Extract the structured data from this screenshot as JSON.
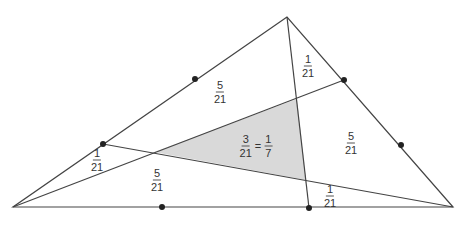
{
  "diagram": {
    "type": "triangle-cevians-area",
    "colors": {
      "stroke": "#444444",
      "fill_shaded": "#d9d9d9",
      "dot": "#222222",
      "background": "#ffffff"
    },
    "vertices": {
      "apex": [
        287,
        17
      ],
      "left": [
        13,
        207
      ],
      "right": [
        453,
        207
      ]
    },
    "dots": [
      {
        "name": "dot-left-side-lower",
        "pos": [
          103,
          144
        ]
      },
      {
        "name": "dot-left-side-upper",
        "pos": [
          195,
          79
        ]
      },
      {
        "name": "dot-right-side-upper",
        "pos": [
          344,
          80
        ]
      },
      {
        "name": "dot-right-side-lower",
        "pos": [
          401,
          145
        ]
      },
      {
        "name": "dot-base-left",
        "pos": [
          162,
          207
        ]
      },
      {
        "name": "dot-base-right",
        "pos": [
          309,
          208
        ]
      }
    ],
    "cevians": [
      {
        "from": [
          13,
          207
        ],
        "to": [
          344,
          80
        ]
      },
      {
        "from": [
          287,
          17
        ],
        "to": [
          309,
          208
        ]
      },
      {
        "from": [
          453,
          207
        ],
        "to": [
          103,
          144
        ]
      }
    ],
    "shaded_triangle": [
      [
        154,
        152
      ],
      [
        297,
        99
      ],
      [
        306,
        180
      ]
    ],
    "labels": [
      {
        "name": "label-top-sliver",
        "num": "1",
        "den": "21",
        "pos": [
          308,
          66
        ]
      },
      {
        "name": "label-upper-left",
        "num": "5",
        "den": "21",
        "pos": [
          220,
          92
        ]
      },
      {
        "name": "label-right",
        "num": "5",
        "den": "21",
        "pos": [
          351,
          143
        ]
      },
      {
        "name": "label-left-sliver",
        "num": "1",
        "den": "21",
        "pos": [
          97,
          160
        ]
      },
      {
        "name": "label-lower-left",
        "num": "5",
        "den": "21",
        "pos": [
          157,
          180
        ]
      },
      {
        "name": "label-bottom-sliver",
        "num": "1",
        "den": "21",
        "pos": [
          330,
          196
        ]
      }
    ],
    "center_label": {
      "num1": "3",
      "den1": "21",
      "equals": "=",
      "num2": "1",
      "den2": "7",
      "pos": [
        256,
        146
      ]
    }
  }
}
